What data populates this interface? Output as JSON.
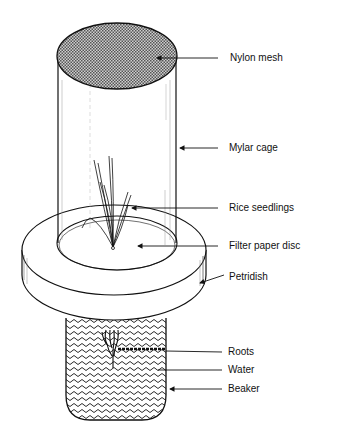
{
  "diagram": {
    "type": "labeled-apparatus-illustration",
    "colors": {
      "ink": "#111111",
      "background": "#ffffff",
      "mesh": "#9a9a9a"
    },
    "labels": [
      {
        "id": "nylon-mesh",
        "text": "Nylon mesh",
        "x": 230,
        "y": 52
      },
      {
        "id": "mylar-cage",
        "text": "Mylar cage",
        "x": 229,
        "y": 142
      },
      {
        "id": "rice-seedlings",
        "text": "Rice seedlings",
        "x": 229,
        "y": 202
      },
      {
        "id": "filter-paper-disc",
        "text": "Filter paper disc",
        "x": 229,
        "y": 240
      },
      {
        "id": "petridish",
        "text": "Petridish",
        "x": 229,
        "y": 271
      },
      {
        "id": "roots",
        "text": "Roots",
        "x": 228,
        "y": 346
      },
      {
        "id": "water",
        "text": "Water",
        "x": 228,
        "y": 364
      },
      {
        "id": "beaker",
        "text": "Beaker",
        "x": 228,
        "y": 383
      }
    ],
    "components": [
      "nylon-mesh-top",
      "mylar-cylinder-cage",
      "rice-seedlings",
      "filter-paper-disc",
      "petri-dish",
      "beaker-with-water",
      "roots"
    ]
  }
}
